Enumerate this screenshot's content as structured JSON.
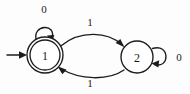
{
  "diagram": {
    "type": "finite-state-machine",
    "title": "",
    "alphabet": [
      "0",
      "1"
    ],
    "colors": {
      "stroke": "#1c1c1c",
      "background": "#fdfdfd",
      "text": "#1a1a1a"
    },
    "start_state": "1",
    "states": [
      {
        "id": "s1",
        "label": "1",
        "accepting": true,
        "is_start": true,
        "cx": 45,
        "cy": 55,
        "r": 18,
        "inner_r": 15
      },
      {
        "id": "s2",
        "label": "2",
        "accepting": false,
        "is_start": false,
        "cx": 137,
        "cy": 57,
        "r": 16,
        "inner_r": 0
      }
    ],
    "transitions": [
      {
        "id": "t-self-1",
        "from": "s1",
        "to": "s1",
        "label": "0",
        "kind": "self-loop",
        "label_x": 44,
        "label_y": 9
      },
      {
        "id": "t-1-to-2",
        "from": "s1",
        "to": "s2",
        "label": "1",
        "kind": "curve-top",
        "label_x": 90,
        "label_y": 22
      },
      {
        "id": "t-2-to-1",
        "from": "s2",
        "to": "s1",
        "label": "1",
        "kind": "curve-bottom",
        "label_x": 90,
        "label_y": 83
      },
      {
        "id": "t-self-2",
        "from": "s2",
        "to": "s2",
        "label": "0",
        "kind": "self-loop",
        "label_x": 179,
        "label_y": 57
      }
    ],
    "start_arrow": {
      "name": "start-arrow",
      "from_x": 7,
      "from_y": 55,
      "to_x": 26,
      "to_y": 55
    }
  }
}
